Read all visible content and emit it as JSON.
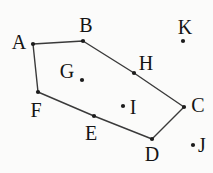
{
  "diagram": {
    "type": "geometry-figure",
    "background_color": "#fbfbfa",
    "line_color": "#3a3a3a",
    "dot_color": "#1c1c1c",
    "label_color": "#141414",
    "dot_radius": 2.1,
    "line_width": 1.4,
    "font_size": 20,
    "polygon_vertices": [
      "A",
      "B",
      "H",
      "C",
      "D",
      "E",
      "F"
    ],
    "points": [
      {
        "id": "A",
        "dot_x": 33,
        "dot_y": 44,
        "label_x": 19,
        "label_y": 42,
        "position": "vertex"
      },
      {
        "id": "B",
        "dot_x": 83,
        "dot_y": 41,
        "label_x": 86,
        "label_y": 25,
        "position": "vertex"
      },
      {
        "id": "K",
        "dot_x": 183,
        "dot_y": 41,
        "label_x": 185,
        "label_y": 27,
        "position": "outside"
      },
      {
        "id": "H",
        "dot_x": 134,
        "dot_y": 73,
        "label_x": 146,
        "label_y": 63,
        "position": "vertex"
      },
      {
        "id": "G",
        "dot_x": 82,
        "dot_y": 80,
        "label_x": 67,
        "label_y": 71,
        "position": "inside"
      },
      {
        "id": "C",
        "dot_x": 184,
        "dot_y": 107,
        "label_x": 198,
        "label_y": 105,
        "position": "vertex"
      },
      {
        "id": "I",
        "dot_x": 123,
        "dot_y": 106,
        "label_x": 133,
        "label_y": 107,
        "position": "inside"
      },
      {
        "id": "F",
        "dot_x": 38,
        "dot_y": 92,
        "label_x": 36,
        "label_y": 110,
        "position": "vertex"
      },
      {
        "id": "E",
        "dot_x": 94,
        "dot_y": 116,
        "label_x": 91,
        "label_y": 133,
        "position": "vertex"
      },
      {
        "id": "D",
        "dot_x": 152,
        "dot_y": 139,
        "label_x": 152,
        "label_y": 154,
        "position": "vertex"
      },
      {
        "id": "J",
        "dot_x": 193,
        "dot_y": 145,
        "label_x": 202,
        "label_y": 145,
        "position": "outside"
      }
    ]
  }
}
